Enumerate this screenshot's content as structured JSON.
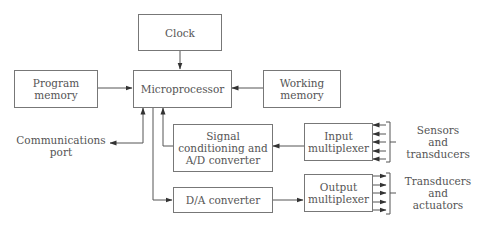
{
  "diagram": {
    "type": "block-diagram",
    "blocks": {
      "clock": "Clock",
      "program_memory": "Program\nmemory",
      "microprocessor": "Microprocessor",
      "working_memory": "Working\nmemory",
      "signal_conditioning": "Signal\nconditioning and\nA/D converter",
      "input_multiplexer": "Input\nmultiplexer",
      "da_converter": "D/A converter",
      "output_multiplexer": "Output\nmultiplexer"
    },
    "labels": {
      "communications_port": "Communications\nport",
      "sensors": "Sensors\nand\ntransducers",
      "actuators": "Transducers\nand\nactuators"
    },
    "connections": [
      {
        "from": "Clock",
        "to": "Microprocessor"
      },
      {
        "from": "Program memory",
        "to": "Microprocessor"
      },
      {
        "from": "Working memory",
        "to": "Microprocessor"
      },
      {
        "from": "Communications port",
        "to": "Microprocessor",
        "bidirectional": true
      },
      {
        "from": "Signal conditioning and A/D converter",
        "to": "Microprocessor"
      },
      {
        "from": "Microprocessor",
        "to": "D/A converter"
      },
      {
        "from": "Input multiplexer",
        "to": "Signal conditioning and A/D converter"
      },
      {
        "from": "D/A converter",
        "to": "Output multiplexer"
      },
      {
        "from": "Sensors and transducers",
        "to": "Input multiplexer",
        "count": 5
      },
      {
        "from": "Output multiplexer",
        "to": "Transducers and actuators",
        "count": 5
      }
    ]
  }
}
